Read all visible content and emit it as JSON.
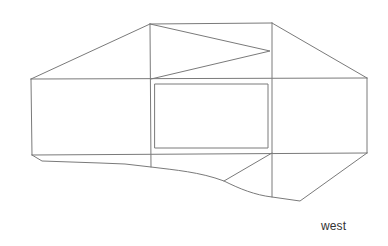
{
  "diagram": {
    "type": "elevation-line-drawing",
    "label": "west",
    "stroke_color": "#7a7a7a",
    "background": "#ffffff"
  }
}
